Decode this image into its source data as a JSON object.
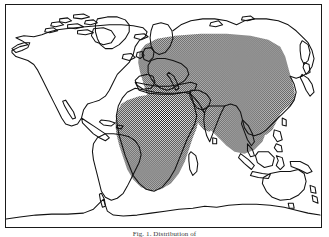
{
  "figure": {
    "type": "distribution-map",
    "caption": "Fig. 1. Distribution of",
    "caption_truncated": true,
    "frame": {
      "border_color": "#1a1a1a",
      "background": "#ffffff"
    }
  },
  "colors": {
    "coastline": "#111111",
    "land_fill": "#ffffff",
    "ocean": "#ffffff",
    "range_stipple_dark": "#1f1f1f",
    "range_stipple_light": "#ffffff",
    "frame": "#1a1a1a",
    "caption_text": "#3a3a3a"
  },
  "legend": {
    "shaded_meaning": "shaded area = distribution range",
    "unshaded_meaning": "unshaded area = outside range"
  },
  "regions": {
    "shaded": [
      "Africa",
      "Madagascar",
      "Southern Europe",
      "Central Europe",
      "Middle East",
      "Arabian Peninsula",
      "Central Asia",
      "South Asia",
      "India",
      "Southeast Asia",
      "Southern China",
      "Indonesia",
      "Philippines"
    ],
    "unshaded": [
      "North America",
      "South America",
      "Greenland",
      "Canadian Arctic",
      "Iceland",
      "British Isles",
      "Scandinavia",
      "Northern Siberia",
      "Japan",
      "Australia",
      "New Zealand",
      "Antarctica"
    ]
  },
  "continents": [
    {
      "name": "North America"
    },
    {
      "name": "South America"
    },
    {
      "name": "Greenland"
    },
    {
      "name": "Europe"
    },
    {
      "name": "Africa"
    },
    {
      "name": "Asia"
    },
    {
      "name": "Australia"
    },
    {
      "name": "Antarctica"
    }
  ],
  "icons": {
    "map": "world-map-icon"
  }
}
